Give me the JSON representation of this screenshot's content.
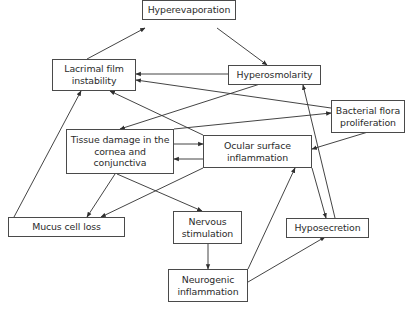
{
  "diagram": {
    "type": "causal-cycle-flowchart",
    "nodes": [
      {
        "id": "hyperevaporation",
        "label": "Hyperevaporation",
        "x": 142,
        "y": 0,
        "w": 94,
        "h": 20
      },
      {
        "id": "lacrimal",
        "label": "Lacrimal film instability",
        "x": 52,
        "y": 59,
        "w": 84,
        "h": 32
      },
      {
        "id": "hyperosmolarity",
        "label": "Hyperosmolarity",
        "x": 228,
        "y": 65,
        "w": 93,
        "h": 20
      },
      {
        "id": "bacterial",
        "label": "Bacterial flora proliferation",
        "x": 331,
        "y": 100,
        "w": 74,
        "h": 33
      },
      {
        "id": "tissue",
        "label": "Tissue damage in the cornea and conjunctiva",
        "x": 66,
        "y": 129,
        "w": 108,
        "h": 45
      },
      {
        "id": "ocular",
        "label": "Ocular surface inflammation",
        "x": 203,
        "y": 135,
        "w": 109,
        "h": 33
      },
      {
        "id": "mucus",
        "label": "Mucus cell loss",
        "x": 8,
        "y": 217,
        "w": 117,
        "h": 20
      },
      {
        "id": "nervous",
        "label": "Nervous stimulation",
        "x": 173,
        "y": 211,
        "w": 69,
        "h": 33
      },
      {
        "id": "hyposecretion",
        "label": "Hyposecretion",
        "x": 286,
        "y": 218,
        "w": 83,
        "h": 20
      },
      {
        "id": "neurogenic",
        "label": "Neurogenic inflammation",
        "x": 168,
        "y": 269,
        "w": 80,
        "h": 33
      }
    ],
    "edges": [
      {
        "from": "lacrimal",
        "to": "hyperevaporation",
        "x1": 87,
        "y1": 59,
        "x2": 145,
        "y2": 28
      },
      {
        "from": "hyperevaporation",
        "to": "hyperosmolarity",
        "x1": 217,
        "y1": 28,
        "x2": 267,
        "y2": 65
      },
      {
        "from": "hyperosmolarity",
        "to": "lacrimal",
        "x1": 228,
        "y1": 74,
        "x2": 136,
        "y2": 74
      },
      {
        "from": "bacterial",
        "to": "lacrimal",
        "x1": 331,
        "y1": 108,
        "x2": 136,
        "y2": 80
      },
      {
        "from": "hyperosmolarity",
        "to": "tissue",
        "x1": 260,
        "y1": 84,
        "x2": 120,
        "y2": 129
      },
      {
        "from": "tissue",
        "to": "bacterial",
        "x1": 174,
        "y1": 129,
        "x2": 331,
        "y2": 113
      },
      {
        "from": "ocular",
        "to": "lacrimal",
        "x1": 203,
        "y1": 135,
        "x2": 110,
        "y2": 91
      },
      {
        "from": "tissue",
        "to": "ocular",
        "x1": 174,
        "y1": 144,
        "x2": 203,
        "y2": 144
      },
      {
        "from": "ocular",
        "to": "tissue",
        "x1": 203,
        "y1": 159,
        "x2": 174,
        "y2": 159
      },
      {
        "from": "bacterial",
        "to": "ocular",
        "x1": 368,
        "y1": 132,
        "x2": 312,
        "y2": 149
      },
      {
        "from": "mucus",
        "to": "lacrimal",
        "x1": 14,
        "y1": 217,
        "x2": 81,
        "y2": 91
      },
      {
        "from": "tissue",
        "to": "mucus",
        "x1": 115,
        "y1": 174,
        "x2": 87,
        "y2": 217
      },
      {
        "from": "tissue",
        "to": "nervous",
        "x1": 117,
        "y1": 174,
        "x2": 202,
        "y2": 211
      },
      {
        "from": "ocular",
        "to": "mucus",
        "x1": 203,
        "y1": 168,
        "x2": 101,
        "y2": 217
      },
      {
        "from": "nervous",
        "to": "neurogenic",
        "x1": 208,
        "y1": 244,
        "x2": 208,
        "y2": 269
      },
      {
        "from": "neurogenic",
        "to": "ocular",
        "x1": 248,
        "y1": 269,
        "x2": 295,
        "y2": 168
      },
      {
        "from": "neurogenic",
        "to": "hyposecretion",
        "x1": 248,
        "y1": 282,
        "x2": 325,
        "y2": 237
      },
      {
        "from": "ocular",
        "to": "hyposecretion",
        "x1": 312,
        "y1": 168,
        "x2": 326,
        "y2": 218
      },
      {
        "from": "hyposecretion",
        "to": "hyperosmolarity",
        "x1": 335,
        "y1": 218,
        "x2": 303,
        "y2": 85
      }
    ],
    "colors": {
      "line": "#2f2f2f",
      "border": "#4a4a4a",
      "text": "#2b2b2b",
      "background": "#ffffff"
    }
  }
}
